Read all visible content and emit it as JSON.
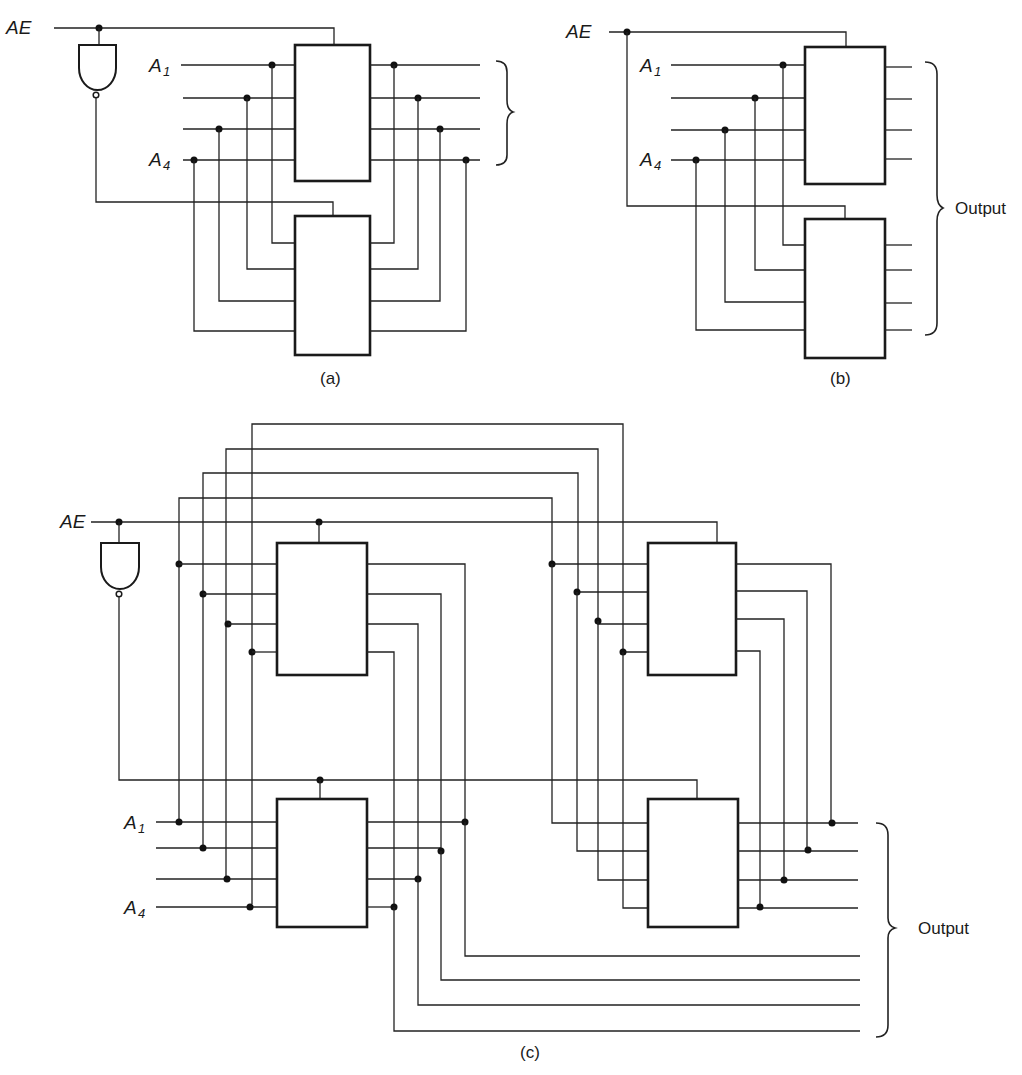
{
  "figure": {
    "panels": [
      {
        "id": "a",
        "caption": "(a)",
        "labels": {
          "enable": "AE",
          "addr_first": "A",
          "addr_first_sub": "1",
          "addr_last": "A",
          "addr_last_sub": "4"
        },
        "blocks": 2,
        "inverter": true
      },
      {
        "id": "b",
        "caption": "(b)",
        "labels": {
          "enable": "AE",
          "addr_first": "A",
          "addr_first_sub": "1",
          "addr_last": "A",
          "addr_last_sub": "4",
          "output": "Output"
        },
        "blocks": 2,
        "inverter": false
      },
      {
        "id": "c",
        "caption": "(c)",
        "labels": {
          "enable": "AE",
          "addr_first": "A",
          "addr_first_sub": "1",
          "addr_last": "A",
          "addr_last_sub": "4",
          "output": "Output"
        },
        "blocks": 4,
        "inverter": true
      }
    ]
  }
}
